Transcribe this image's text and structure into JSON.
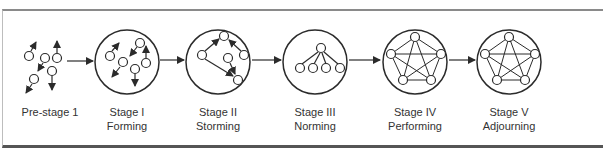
{
  "stages": [
    {
      "id": "pre-stage-1",
      "line1": "Pre-stage 1",
      "line2": "",
      "cx": 50
    },
    {
      "id": "stage-1",
      "line1": "Stage I",
      "line2": "Forming",
      "cx": 127
    },
    {
      "id": "stage-2",
      "line1": "Stage II",
      "line2": "Storming",
      "cx": 218
    },
    {
      "id": "stage-3",
      "line1": "Stage III",
      "line2": "Norming",
      "cx": 315
    },
    {
      "id": "stage-4",
      "line1": "Stage IV",
      "line2": "Performing",
      "cx": 415
    },
    {
      "id": "stage-5",
      "line1": "Stage V",
      "line2": "Adjourning",
      "cx": 509
    }
  ],
  "colors": {
    "stroke": "#2b2b2b",
    "text": "#333333",
    "border": "#555555"
  }
}
